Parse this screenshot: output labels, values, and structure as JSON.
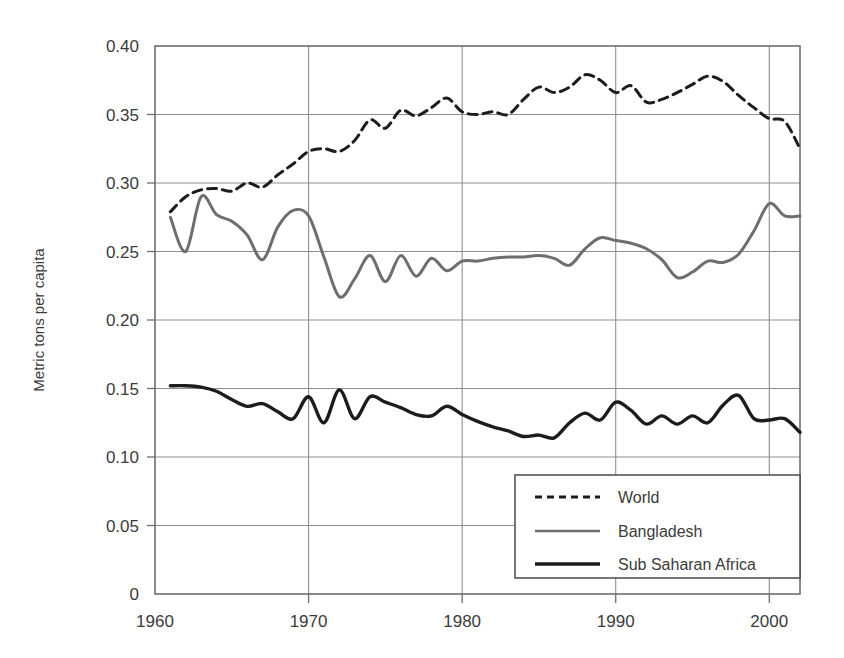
{
  "chart_data": {
    "type": "line",
    "title": "",
    "subtitle": "",
    "xlabel": "",
    "ylabel": "Metric tons per capita",
    "xlim": [
      1960,
      2002
    ],
    "ylim": [
      0,
      0.4
    ],
    "grid": true,
    "legend_position": "bottom-right",
    "x_ticks": [
      "1960",
      "1970",
      "1980",
      "1990",
      "2000"
    ],
    "x_tick_values": [
      1960,
      1970,
      1980,
      1990,
      2000
    ],
    "y_ticks": [
      "0",
      "0.05",
      "0.10",
      "0.15",
      "0.20",
      "0.25",
      "0.30",
      "0.35",
      "0.40"
    ],
    "y_tick_values": [
      0,
      0.05,
      0.1,
      0.15,
      0.2,
      0.25,
      0.3,
      0.35,
      0.4
    ],
    "series": [
      {
        "name": "World",
        "style": "dashed",
        "color": "#1c1c1c",
        "width": 3.0,
        "x": [
          1961,
          1962,
          1963,
          1964,
          1965,
          1966,
          1967,
          1968,
          1969,
          1970,
          1971,
          1972,
          1973,
          1974,
          1975,
          1976,
          1977,
          1978,
          1979,
          1980,
          1981,
          1982,
          1983,
          1984,
          1985,
          1986,
          1987,
          1988,
          1989,
          1990,
          1991,
          1992,
          1993,
          1994,
          1995,
          1996,
          1997,
          1998,
          1999,
          2000,
          2001,
          2002
        ],
        "values": [
          0.279,
          0.29,
          0.295,
          0.296,
          0.294,
          0.3,
          0.297,
          0.306,
          0.314,
          0.323,
          0.325,
          0.323,
          0.331,
          0.346,
          0.34,
          0.353,
          0.349,
          0.355,
          0.362,
          0.352,
          0.35,
          0.352,
          0.35,
          0.361,
          0.37,
          0.366,
          0.37,
          0.379,
          0.375,
          0.366,
          0.371,
          0.359,
          0.361,
          0.366,
          0.372,
          0.378,
          0.374,
          0.364,
          0.355,
          0.347,
          0.345,
          0.325
        ]
      },
      {
        "name": "Bangladesh",
        "style": "solid",
        "color": "#6e6e6e",
        "width": 3.0,
        "x": [
          1961,
          1962,
          1963,
          1964,
          1965,
          1966,
          1967,
          1968,
          1969,
          1970,
          1971,
          1972,
          1973,
          1974,
          1975,
          1976,
          1977,
          1978,
          1979,
          1980,
          1981,
          1982,
          1983,
          1984,
          1985,
          1986,
          1987,
          1988,
          1989,
          1990,
          1991,
          1992,
          1993,
          1994,
          1995,
          1996,
          1997,
          1998,
          1999,
          2000,
          2001,
          2002
        ],
        "values": [
          0.275,
          0.25,
          0.29,
          0.277,
          0.272,
          0.262,
          0.244,
          0.268,
          0.28,
          0.276,
          0.246,
          0.217,
          0.23,
          0.247,
          0.228,
          0.247,
          0.232,
          0.245,
          0.236,
          0.243,
          0.243,
          0.245,
          0.246,
          0.246,
          0.247,
          0.245,
          0.24,
          0.252,
          0.26,
          0.258,
          0.256,
          0.252,
          0.244,
          0.231,
          0.235,
          0.243,
          0.242,
          0.248,
          0.265,
          0.285,
          0.276,
          0.276
        ]
      },
      {
        "name": "Sub Saharan Africa",
        "style": "solid",
        "color": "#1c1c1c",
        "width": 3.4,
        "x": [
          1961,
          1962,
          1963,
          1964,
          1965,
          1966,
          1967,
          1968,
          1969,
          1970,
          1971,
          1972,
          1973,
          1974,
          1975,
          1976,
          1977,
          1978,
          1979,
          1980,
          1981,
          1982,
          1983,
          1984,
          1985,
          1986,
          1987,
          1988,
          1989,
          1990,
          1991,
          1992,
          1993,
          1994,
          1995,
          1996,
          1997,
          1998,
          1999,
          2000,
          2001,
          2002
        ],
        "values": [
          0.152,
          0.152,
          0.151,
          0.148,
          0.142,
          0.137,
          0.139,
          0.133,
          0.128,
          0.144,
          0.125,
          0.149,
          0.128,
          0.144,
          0.14,
          0.136,
          0.131,
          0.13,
          0.137,
          0.131,
          0.126,
          0.122,
          0.119,
          0.115,
          0.116,
          0.114,
          0.125,
          0.132,
          0.127,
          0.14,
          0.134,
          0.124,
          0.13,
          0.124,
          0.13,
          0.125,
          0.138,
          0.145,
          0.128,
          0.127,
          0.128,
          0.118
        ]
      }
    ]
  },
  "axis": {
    "y_title": "Metric tons per capita"
  },
  "legend": {
    "items": [
      {
        "label": "World"
      },
      {
        "label": "Bangladesh"
      },
      {
        "label": "Sub Saharan Africa"
      }
    ]
  }
}
